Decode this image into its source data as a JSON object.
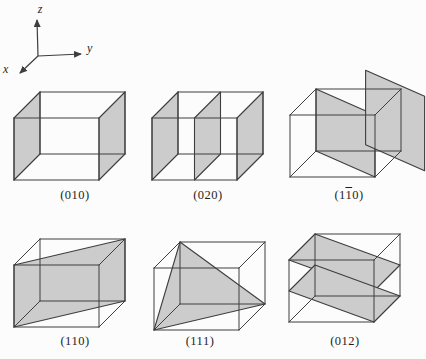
{
  "colors": {
    "plane_fill": "#cccccc",
    "line": "#3e3e3e",
    "label": "#1e1e1e",
    "background": "#fcfcfc"
  },
  "axes": {
    "x": "x",
    "y": "y",
    "z": "z"
  },
  "cubes": [
    {
      "label": {
        "pre": "(010)",
        "bar": "",
        "post": ""
      },
      "planes": [
        {
          "name": "left-face-y0",
          "points": [
            [
              0,
              0,
              0
            ],
            [
              1,
              0,
              0
            ],
            [
              1,
              0,
              1
            ],
            [
              0,
              0,
              1
            ]
          ]
        },
        {
          "name": "right-face-y1",
          "points": [
            [
              0,
              1,
              0
            ],
            [
              1,
              1,
              0
            ],
            [
              1,
              1,
              1
            ],
            [
              0,
              1,
              1
            ]
          ]
        }
      ]
    },
    {
      "label": {
        "pre": "(020)",
        "bar": "",
        "post": ""
      },
      "planes": [
        {
          "name": "left-face-y0",
          "points": [
            [
              0,
              0,
              0
            ],
            [
              1,
              0,
              0
            ],
            [
              1,
              0,
              1
            ],
            [
              0,
              0,
              1
            ]
          ]
        },
        {
          "name": "mid-plane-y05",
          "points": [
            [
              0,
              0.5,
              0
            ],
            [
              1,
              0.5,
              0
            ],
            [
              1,
              0.5,
              1
            ],
            [
              0,
              0.5,
              1
            ]
          ]
        },
        {
          "name": "right-face-y1",
          "points": [
            [
              0,
              1,
              0
            ],
            [
              1,
              1,
              0
            ],
            [
              1,
              1,
              1
            ],
            [
              0,
              1,
              1
            ]
          ]
        }
      ]
    },
    {
      "label": {
        "pre": "(1",
        "bar": "1",
        "post": "0)"
      },
      "planes": [
        {
          "name": "diagonal-plane-inside",
          "points": [
            [
              0,
              0,
              1
            ],
            [
              1,
              1,
              1
            ],
            [
              1,
              1,
              0
            ],
            [
              0,
              0,
              0
            ]
          ]
        },
        {
          "name": "parallel-plane-outside",
          "points": [
            [
              -0.6,
              0.4,
              1.05
            ],
            [
              0.4,
              1.4,
              1.05
            ],
            [
              0.4,
              1.4,
              -0.15
            ],
            [
              -0.6,
              0.4,
              -0.15
            ]
          ]
        }
      ]
    },
    {
      "label": {
        "pre": "(110)",
        "bar": "",
        "post": ""
      },
      "planes": [
        {
          "name": "diagonal-plane",
          "points": [
            [
              1,
              0,
              1
            ],
            [
              0,
              1,
              1
            ],
            [
              0,
              1,
              0
            ],
            [
              1,
              0,
              0
            ]
          ]
        }
      ]
    },
    {
      "label": {
        "pre": "(111)",
        "bar": "",
        "post": ""
      },
      "planes": [
        {
          "name": "corner-triangle",
          "points": [
            [
              0,
              0,
              1
            ],
            [
              1,
              0,
              0
            ],
            [
              0,
              1,
              0
            ]
          ]
        }
      ]
    },
    {
      "label": {
        "pre": "(012)",
        "bar": "",
        "post": ""
      },
      "planes": [
        {
          "name": "upper-sloped-plane",
          "points": [
            [
              1,
              0,
              1
            ],
            [
              0,
              0,
              1
            ],
            [
              0,
              1,
              0.5
            ],
            [
              1,
              1,
              0.5
            ]
          ]
        },
        {
          "name": "lower-sloped-plane",
          "points": [
            [
              1,
              0,
              0.5
            ],
            [
              0,
              0,
              0.5
            ],
            [
              0,
              1,
              0
            ],
            [
              1,
              1,
              0
            ]
          ]
        }
      ]
    }
  ]
}
